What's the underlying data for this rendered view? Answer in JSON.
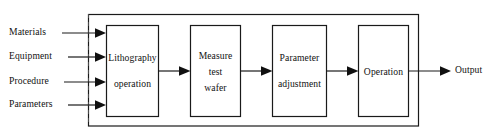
{
  "diagram": {
    "stroke_color": "#1a1a1a",
    "text_color": "#111111",
    "background": "#ffffff",
    "inputs": [
      {
        "label": "Materials"
      },
      {
        "label": "Equipment"
      },
      {
        "label": "Procedure"
      },
      {
        "label": "Parameters"
      }
    ],
    "blocks": [
      {
        "id": "lithography",
        "lines": [
          "Lithography",
          "operation"
        ]
      },
      {
        "id": "measure",
        "lines": [
          "Measure",
          "test",
          "wafer"
        ]
      },
      {
        "id": "parameter",
        "lines": [
          "Parameter",
          "adjustment"
        ]
      },
      {
        "id": "operation",
        "lines": [
          "Operation"
        ]
      }
    ],
    "output": {
      "label": "Output"
    },
    "feedback": {
      "label": ""
    }
  }
}
